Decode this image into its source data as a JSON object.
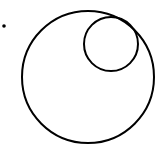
{
  "diagram": {
    "stroke_color": "#000000",
    "background": "#ffffff",
    "outer_circle": {
      "cx": 88,
      "cy": 77,
      "r": 66
    },
    "inner_circle": {
      "cx": 111,
      "cy": 44,
      "r": 27
    },
    "dot": {
      "cx": 4,
      "cy": 26,
      "r": 1.8
    }
  }
}
